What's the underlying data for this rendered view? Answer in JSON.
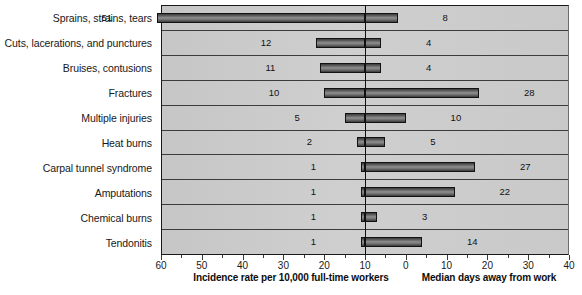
{
  "chart_data": {
    "type": "bar",
    "orientation": "horizontal",
    "subtype": "bidirectional-tornado",
    "title": "",
    "categories": [
      "Sprains, strains, tears",
      "Cuts, lacerations, and punctures",
      "Bruises, contusions",
      "Fractures",
      "Multiple injuries",
      "Heat burns",
      "Carpal tunnel syndrome",
      "Amputations",
      "Chemical burns",
      "Tendonitis"
    ],
    "series": [
      {
        "name": "Incidence rate per 10,000 full-time workers",
        "side": "left",
        "values": [
          51,
          12,
          11,
          10,
          5,
          2,
          1,
          1,
          1,
          1
        ]
      },
      {
        "name": "Median days away from work",
        "side": "right",
        "values": [
          8,
          4,
          4,
          28,
          10,
          5,
          27,
          22,
          3,
          14
        ]
      }
    ],
    "xlabel_left": "Incidence rate per 10,000 full-time workers",
    "xlabel_right": "Median days away from work",
    "ylabel": "",
    "xticks_left": [
      60,
      50,
      40,
      30,
      20,
      10,
      0
    ],
    "xticks_right": [
      10,
      20,
      30,
      40
    ],
    "xlim_left": [
      0,
      60
    ],
    "xlim_right": [
      0,
      40
    ],
    "grid": true,
    "legend": "none",
    "colors": {
      "plot_background": "#cacaca",
      "bar_fill": "#8f8f8f",
      "bar_border": "#121212",
      "axis": "#1a1a1a",
      "text": "#161616"
    }
  },
  "caption_remnant": ""
}
